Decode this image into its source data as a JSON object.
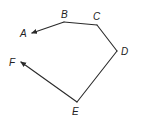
{
  "diagram": {
    "type": "polyline-path",
    "stroke_color": "#2a2a2a",
    "points": [
      {
        "id": "A",
        "label": "A",
        "x": 32,
        "y": 33,
        "label_x": 20,
        "label_y": 37,
        "role": "arrow-end"
      },
      {
        "id": "B",
        "label": "B",
        "x": 64,
        "y": 22,
        "label_x": 61,
        "label_y": 18,
        "role": "vertex"
      },
      {
        "id": "C",
        "label": "C",
        "x": 97,
        "y": 25,
        "label_x": 93,
        "label_y": 20,
        "role": "vertex"
      },
      {
        "id": "D",
        "label": "D",
        "x": 117,
        "y": 51,
        "label_x": 121,
        "label_y": 55,
        "role": "vertex"
      },
      {
        "id": "E",
        "label": "E",
        "x": 77,
        "y": 102,
        "label_x": 72,
        "label_y": 115,
        "role": "vertex"
      },
      {
        "id": "F",
        "label": "F",
        "x": 21,
        "y": 62,
        "label_x": 9,
        "label_y": 66,
        "role": "arrow-end"
      }
    ],
    "segments": [
      {
        "from": "B",
        "to": "A",
        "arrow": true
      },
      {
        "from": "B",
        "to": "C",
        "arrow": false
      },
      {
        "from": "C",
        "to": "D",
        "arrow": false
      },
      {
        "from": "D",
        "to": "E",
        "arrow": false
      },
      {
        "from": "E",
        "to": "F",
        "arrow": true
      }
    ]
  }
}
